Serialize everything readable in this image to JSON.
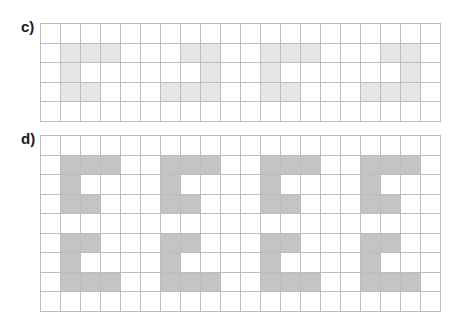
{
  "exercises": [
    {
      "label": "c)",
      "rows": 5,
      "cols": 20,
      "fill_color": "#e6e6e6",
      "outline_color": "#8a8a8a",
      "shapes": [
        {
          "cells": [
            [
              1,
              1
            ],
            [
              1,
              2
            ],
            [
              1,
              3
            ],
            [
              2,
              1
            ],
            [
              3,
              1
            ],
            [
              3,
              2
            ]
          ]
        },
        {
          "cells": [
            [
              1,
              7
            ],
            [
              1,
              8
            ],
            [
              2,
              8
            ],
            [
              3,
              6
            ],
            [
              3,
              7
            ],
            [
              3,
              8
            ]
          ]
        },
        {
          "cells": [
            [
              1,
              11
            ],
            [
              1,
              12
            ],
            [
              1,
              13
            ],
            [
              2,
              11
            ],
            [
              3,
              11
            ],
            [
              3,
              12
            ]
          ]
        },
        {
          "cells": [
            [
              1,
              17
            ],
            [
              1,
              18
            ],
            [
              2,
              18
            ],
            [
              3,
              16
            ],
            [
              3,
              17
            ],
            [
              3,
              18
            ]
          ]
        }
      ]
    },
    {
      "label": "d)",
      "rows": 9,
      "cols": 20,
      "fill_color": "#c4c4c4",
      "outline_color": "#9a9a9a",
      "shapes": [
        {
          "cells": [
            [
              1,
              1
            ],
            [
              1,
              2
            ],
            [
              1,
              3
            ],
            [
              2,
              1
            ],
            [
              3,
              1
            ],
            [
              3,
              2
            ]
          ]
        },
        {
          "cells": [
            [
              1,
              6
            ],
            [
              1,
              7
            ],
            [
              1,
              8
            ],
            [
              2,
              6
            ],
            [
              3,
              6
            ],
            [
              3,
              7
            ]
          ]
        },
        {
          "cells": [
            [
              1,
              11
            ],
            [
              1,
              12
            ],
            [
              1,
              13
            ],
            [
              2,
              11
            ],
            [
              3,
              11
            ],
            [
              3,
              12
            ]
          ]
        },
        {
          "cells": [
            [
              1,
              16
            ],
            [
              1,
              17
            ],
            [
              1,
              18
            ],
            [
              2,
              16
            ],
            [
              3,
              16
            ],
            [
              3,
              17
            ]
          ]
        },
        {
          "cells": [
            [
              5,
              1
            ],
            [
              5,
              2
            ],
            [
              6,
              1
            ],
            [
              7,
              1
            ],
            [
              7,
              2
            ],
            [
              7,
              3
            ]
          ]
        },
        {
          "cells": [
            [
              5,
              6
            ],
            [
              5,
              7
            ],
            [
              6,
              6
            ],
            [
              7,
              6
            ],
            [
              7,
              7
            ],
            [
              7,
              8
            ]
          ]
        },
        {
          "cells": [
            [
              5,
              11
            ],
            [
              5,
              12
            ],
            [
              6,
              11
            ],
            [
              7,
              11
            ],
            [
              7,
              12
            ],
            [
              7,
              13
            ]
          ]
        },
        {
          "cells": [
            [
              5,
              16
            ],
            [
              5,
              17
            ],
            [
              6,
              16
            ],
            [
              7,
              16
            ],
            [
              7,
              17
            ],
            [
              7,
              18
            ]
          ]
        }
      ]
    }
  ]
}
